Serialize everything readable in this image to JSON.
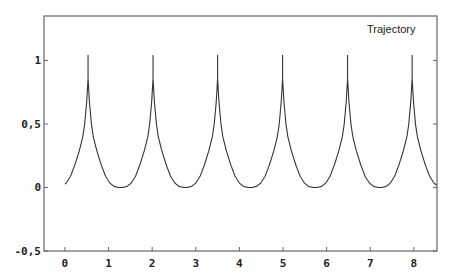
{
  "chart_data": {
    "type": "line",
    "title": "",
    "xlabel": "",
    "ylabel": "",
    "xlim": [
      -0.48,
      8.53
    ],
    "ylim": [
      -0.5,
      1.35
    ],
    "grid": false,
    "legend": {
      "position": "top-right",
      "entries": [
        "Trajectory"
      ]
    },
    "x_ticks": [
      0,
      1,
      2,
      3,
      4,
      5,
      6,
      7,
      8
    ],
    "x_tick_labels": [
      "0",
      "1",
      "2",
      "3",
      "4",
      "5",
      "6",
      "7",
      "8"
    ],
    "y_ticks": [
      -0.5,
      0,
      0.5,
      1
    ],
    "y_tick_labels": [
      "-0,5",
      "0",
      "0,5",
      "1"
    ],
    "series": [
      {
        "name": "Trajectory",
        "color": "#333333",
        "x_start": 0,
        "x_end": 8.53,
        "peak_x": [
          0.53,
          2.02,
          3.5,
          4.99,
          6.48,
          7.96
        ],
        "peak_y": 1.04,
        "shoulder_y": 0.86,
        "profile_distance": [
          0.0,
          0.03,
          0.077,
          0.12,
          0.2,
          0.3,
          0.4,
          0.5,
          0.6,
          0.7,
          0.8
        ],
        "profile_y": [
          0.86,
          0.68,
          0.5,
          0.4,
          0.29,
          0.18,
          0.09,
          0.035,
          0.008,
          0.0,
          0.0
        ]
      }
    ]
  }
}
